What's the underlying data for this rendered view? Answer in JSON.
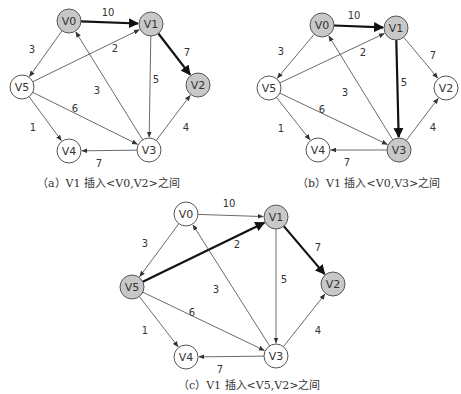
{
  "colors": {
    "highlight_fill": "#c8c8c8",
    "normal_fill": "#ffffff",
    "stroke": "#555555",
    "edge": "#444444",
    "bold_edge": "#111111"
  },
  "node_radius": 12,
  "diagrams": [
    {
      "id": "a",
      "caption": "（a）V1 插入<V0,V2>之间",
      "caption_pos": [
        37,
        174
      ],
      "nodes": [
        {
          "id": "V0",
          "label": "V0",
          "x": 69,
          "y": 21,
          "highlighted": true
        },
        {
          "id": "V1",
          "label": "V1",
          "x": 151,
          "y": 24,
          "highlighted": true
        },
        {
          "id": "V2",
          "label": "V2",
          "x": 198,
          "y": 85,
          "highlighted": true
        },
        {
          "id": "V3",
          "label": "V3",
          "x": 149,
          "y": 150,
          "highlighted": false
        },
        {
          "id": "V4",
          "label": "V4",
          "x": 69,
          "y": 151,
          "highlighted": false
        },
        {
          "id": "V5",
          "label": "V5",
          "x": 22,
          "y": 87,
          "highlighted": false
        }
      ],
      "edges": [
        {
          "from": "V0",
          "to": "V1",
          "weight": "10",
          "bold": true,
          "lx": 108,
          "ly": 12
        },
        {
          "from": "V0",
          "to": "V5",
          "weight": "3",
          "bold": false,
          "lx": 32,
          "ly": 49
        },
        {
          "from": "V5",
          "to": "V1",
          "weight": "2",
          "bold": false,
          "lx": 115,
          "ly": 48
        },
        {
          "from": "V1",
          "to": "V2",
          "weight": "7",
          "bold": true,
          "lx": 187,
          "ly": 52
        },
        {
          "from": "V1",
          "to": "V3",
          "weight": "5",
          "bold": false,
          "lx": 156,
          "ly": 79
        },
        {
          "from": "V3",
          "to": "V0",
          "weight": "3",
          "bold": false,
          "lx": 97,
          "ly": 90
        },
        {
          "from": "V5",
          "to": "V3",
          "weight": "6",
          "bold": false,
          "lx": 75,
          "ly": 108
        },
        {
          "from": "V5",
          "to": "V4",
          "weight": "1",
          "bold": false,
          "lx": 33,
          "ly": 127
        },
        {
          "from": "V3",
          "to": "V2",
          "weight": "4",
          "bold": false,
          "lx": 186,
          "ly": 127
        },
        {
          "from": "V3",
          "to": "V4",
          "weight": "7",
          "bold": false,
          "lx": 99,
          "ly": 163
        }
      ]
    },
    {
      "id": "b",
      "caption": "（b）V1 插入<V0,V3>之间",
      "caption_pos": [
        297,
        174
      ],
      "nodes": [
        {
          "id": "V0",
          "label": "V0",
          "x": 322,
          "y": 25,
          "highlighted": true
        },
        {
          "id": "V1",
          "label": "V1",
          "x": 396,
          "y": 28,
          "highlighted": true
        },
        {
          "id": "V2",
          "label": "V2",
          "x": 446,
          "y": 88,
          "highlighted": false
        },
        {
          "id": "V3",
          "label": "V3",
          "x": 399,
          "y": 150,
          "highlighted": true
        },
        {
          "id": "V4",
          "label": "V4",
          "x": 318,
          "y": 150,
          "highlighted": false
        },
        {
          "id": "V5",
          "label": "V5",
          "x": 269,
          "y": 88,
          "highlighted": false
        }
      ],
      "edges": [
        {
          "from": "V0",
          "to": "V1",
          "weight": "10",
          "bold": true,
          "lx": 354,
          "ly": 15
        },
        {
          "from": "V0",
          "to": "V5",
          "weight": "3",
          "bold": false,
          "lx": 281,
          "ly": 51
        },
        {
          "from": "V5",
          "to": "V1",
          "weight": "2",
          "bold": false,
          "lx": 363,
          "ly": 52
        },
        {
          "from": "V1",
          "to": "V2",
          "weight": "7",
          "bold": false,
          "lx": 433,
          "ly": 55
        },
        {
          "from": "V1",
          "to": "V3",
          "weight": "5",
          "bold": true,
          "lx": 404,
          "ly": 82
        },
        {
          "from": "V3",
          "to": "V0",
          "weight": "3",
          "bold": false,
          "lx": 345,
          "ly": 92
        },
        {
          "from": "V5",
          "to": "V3",
          "weight": "6",
          "bold": false,
          "lx": 322,
          "ly": 109
        },
        {
          "from": "V5",
          "to": "V4",
          "weight": "1",
          "bold": false,
          "lx": 281,
          "ly": 128
        },
        {
          "from": "V3",
          "to": "V2",
          "weight": "4",
          "bold": false,
          "lx": 433,
          "ly": 127
        },
        {
          "from": "V3",
          "to": "V4",
          "weight": "7",
          "bold": false,
          "lx": 347,
          "ly": 162
        }
      ]
    },
    {
      "id": "c",
      "caption": "（c）V1 插入<V5,V2>之间",
      "caption_pos": [
        178,
        376
      ],
      "nodes": [
        {
          "id": "V0",
          "label": "V0",
          "x": 186,
          "y": 214,
          "highlighted": false
        },
        {
          "id": "V1",
          "label": "V1",
          "x": 276,
          "y": 217,
          "highlighted": true
        },
        {
          "id": "V2",
          "label": "V2",
          "x": 333,
          "y": 284,
          "highlighted": true
        },
        {
          "id": "V3",
          "label": "V3",
          "x": 276,
          "y": 356,
          "highlighted": false
        },
        {
          "id": "V4",
          "label": "V4",
          "x": 186,
          "y": 357,
          "highlighted": false
        },
        {
          "id": "V5",
          "label": "V5",
          "x": 132,
          "y": 287,
          "highlighted": true
        }
      ],
      "edges": [
        {
          "from": "V0",
          "to": "V1",
          "weight": "10",
          "bold": false,
          "lx": 229,
          "ly": 203
        },
        {
          "from": "V0",
          "to": "V5",
          "weight": "3",
          "bold": false,
          "lx": 145,
          "ly": 243
        },
        {
          "from": "V5",
          "to": "V1",
          "weight": "2",
          "bold": true,
          "lx": 237,
          "ly": 244
        },
        {
          "from": "V1",
          "to": "V2",
          "weight": "7",
          "bold": true,
          "lx": 318,
          "ly": 247
        },
        {
          "from": "V1",
          "to": "V3",
          "weight": "5",
          "bold": false,
          "lx": 284,
          "ly": 279
        },
        {
          "from": "V3",
          "to": "V0",
          "weight": "3",
          "bold": false,
          "lx": 216,
          "ly": 289
        },
        {
          "from": "V5",
          "to": "V3",
          "weight": "6",
          "bold": false,
          "lx": 192,
          "ly": 312
        },
        {
          "from": "V5",
          "to": "V4",
          "weight": "1",
          "bold": false,
          "lx": 145,
          "ly": 330
        },
        {
          "from": "V3",
          "to": "V2",
          "weight": "4",
          "bold": false,
          "lx": 318,
          "ly": 330
        },
        {
          "from": "V3",
          "to": "V4",
          "weight": "7",
          "bold": false,
          "lx": 220,
          "ly": 369
        }
      ]
    }
  ]
}
